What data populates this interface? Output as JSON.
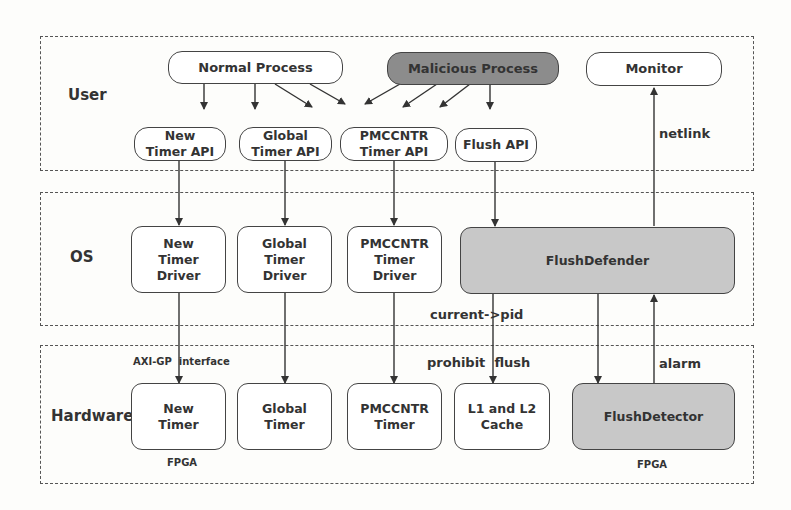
{
  "layers": {
    "user": {
      "label": "User"
    },
    "os": {
      "label": "OS"
    },
    "hardware": {
      "label": "Hardware"
    }
  },
  "nodes": {
    "normal_process": "Normal Process",
    "malicious_process": "Malicious Process",
    "monitor": "Monitor",
    "new_timer_api": "New\nTimer API",
    "global_timer_api": "Global\nTimer API",
    "pmccntr_timer_api": "PMCCNTR\nTimer API",
    "flush_api": "Flush API",
    "new_timer_driver": "New\nTimer\nDriver",
    "global_timer_driver": "Global\nTimer\nDriver",
    "pmccntr_timer_driver": "PMCCNTR\nTimer\nDriver",
    "flush_defender": "FlushDefender",
    "new_timer": "New\nTimer",
    "global_timer": "Global\nTimer",
    "pmccntr_timer": "PMCCNTR\nTimer",
    "l1_l2_cache": "L1 and L2\nCache",
    "flush_detector": "FlushDetector"
  },
  "edge_labels": {
    "netlink": "netlink",
    "current_pid": "current->pid",
    "axi_gp": "AXI-GP  interface",
    "prohibit_flush": "prohibit  flush",
    "alarm": "alarm",
    "fpga_new_timer": "FPGA",
    "fpga_flush_detector": "FPGA"
  },
  "colors": {
    "malicious_fill": "#8c8c8c",
    "defender_fill": "#c8c8c8",
    "stroke": "#444444"
  }
}
